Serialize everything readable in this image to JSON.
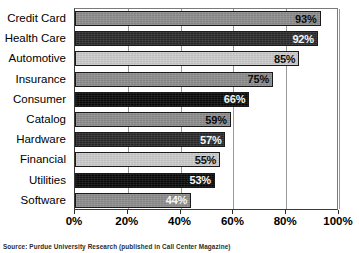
{
  "chart_data": {
    "type": "bar",
    "orientation": "horizontal",
    "title": "",
    "subtitle": "",
    "xlabel": "",
    "ylabel": "",
    "xlim": [
      0,
      100
    ],
    "grid": true,
    "legend": null,
    "categories": [
      "Credit Card",
      "Health Care",
      "Automotive",
      "Insurance",
      "Consumer",
      "Catalog",
      "Hardware",
      "Financial",
      "Utilities",
      "Software"
    ],
    "values": [
      93,
      92,
      85,
      75,
      66,
      59,
      57,
      55,
      53,
      44
    ],
    "value_labels": [
      "93%",
      "92%",
      "85%",
      "75%",
      "66%",
      "59%",
      "57%",
      "55%",
      "53%",
      "44%"
    ],
    "bar_styles": [
      "medium",
      "dark",
      "light",
      "medium",
      "black",
      "medium",
      "dark",
      "light",
      "black",
      "medium-w"
    ],
    "xticks": [
      0,
      20,
      40,
      60,
      80,
      100
    ],
    "xtick_labels": [
      "0%",
      "20%",
      "40%",
      "60%",
      "80%",
      "100%"
    ],
    "annotation": "Source: Purdue University Research (published in Call Center Magazine)",
    "colors": {
      "medium": "#8d8d8d",
      "dark": "#2b2b2b",
      "light": "#cccccc",
      "black": "#0a0a0a",
      "bar_outline": "#1a1a1a",
      "axis": "#2a2a2a",
      "grid": "#9a9a9a",
      "background": "#ffffff"
    }
  }
}
